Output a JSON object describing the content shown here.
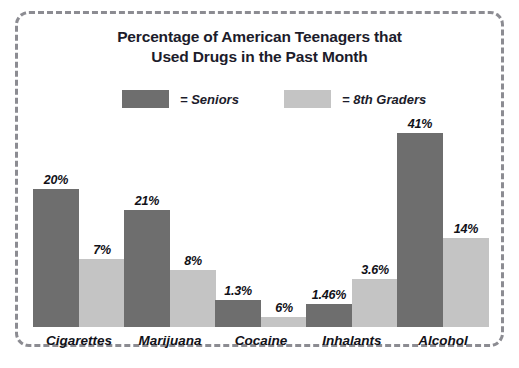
{
  "chart_data": {
    "type": "bar",
    "title": "Percentage of American Teenagers that Used Drugs in the Past Month",
    "title_lines": [
      "Percentage of American Teenagers that",
      "Used Drugs in the Past Month"
    ],
    "xlabel": "",
    "ylabel": "",
    "grid": false,
    "legend_position": "top",
    "categories": [
      "Cigarettes",
      "Marijuana",
      "Cocaine",
      "Inhalants",
      "Alcohol"
    ],
    "series": [
      {
        "name": "Seniors",
        "color": "#6e6e6e",
        "values": [
          20,
          21,
          1.3,
          1.46,
          41
        ],
        "labels": [
          "20%",
          "21%",
          "1.3%",
          "1.46%",
          "41%"
        ],
        "drawn_heights_px": [
          138,
          117,
          27,
          23,
          194
        ]
      },
      {
        "name": "8th Graders",
        "color": "#c4c4c4",
        "values": [
          7,
          8,
          6,
          3.6,
          14
        ],
        "labels": [
          "7%",
          "8%",
          "6%",
          "3.6%",
          "14%"
        ],
        "drawn_heights_px": [
          68,
          57,
          10,
          48,
          89
        ]
      }
    ]
  },
  "legend": {
    "items": [
      {
        "equals": "= Seniors",
        "color": "#6e6e6e"
      },
      {
        "equals": "= 8th Graders",
        "color": "#c4c4c4"
      }
    ]
  },
  "frame": {
    "border_color": "#8c8c92",
    "background": "#ffffff"
  }
}
